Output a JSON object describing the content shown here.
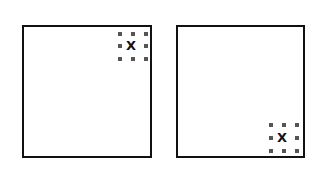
{
  "panels": [
    {
      "id": "left",
      "marker_label": "X",
      "marker_position": "top-right"
    },
    {
      "id": "right",
      "marker_label": "X",
      "marker_position": "bottom-right"
    }
  ],
  "colors": {
    "border": "#111111",
    "dot": "#555555",
    "background": "#ffffff"
  }
}
